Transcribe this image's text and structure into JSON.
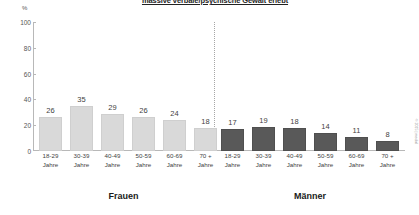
{
  "chart_data": {
    "type": "bar",
    "title": "massive verbale/psychische Gewalt erlebt",
    "xlabel": "",
    "ylabel": "%",
    "ylim": [
      0,
      100
    ],
    "yticks": [
      0,
      20,
      40,
      60,
      80,
      100
    ],
    "grid": false,
    "legend_position": "none",
    "categories": [
      "18-29 Jahre",
      "30-39 Jahre",
      "40-49 Jahre",
      "50-59 Jahre",
      "60-69 Jahre",
      "70 + Jahre"
    ],
    "category_lines": [
      {
        "line1": "18-29",
        "line2": "Jahre"
      },
      {
        "line1": "30-39",
        "line2": "Jahre"
      },
      {
        "line1": "40-49",
        "line2": "Jahre"
      },
      {
        "line1": "50-59",
        "line2": "Jahre"
      },
      {
        "line1": "60-69",
        "line2": "Jahre"
      },
      {
        "line1": "70 +",
        "line2": "Jahre"
      }
    ],
    "series": [
      {
        "name": "Frauen",
        "color": "#d9d9d9",
        "values": [
          26,
          35,
          29,
          26,
          24,
          18
        ]
      },
      {
        "name": "Männer",
        "color": "#595959",
        "values": [
          17,
          19,
          18,
          14,
          11,
          8
        ]
      }
    ]
  },
  "axis": {
    "unit": "%",
    "ticks": [
      "100",
      "80",
      "60",
      "40",
      "20",
      "0"
    ]
  },
  "groups": {
    "women_label": "Frauen",
    "men_label": "Männer"
  },
  "credit": "© 2015 | medial"
}
